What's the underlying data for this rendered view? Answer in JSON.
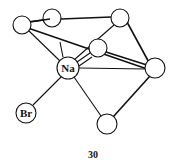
{
  "figure": {
    "caption": "30",
    "colors": {
      "stroke": "#111111",
      "background": "#ffffff"
    }
  },
  "atoms": [
    {
      "id": "c1",
      "label": "",
      "x": 22,
      "y": 25,
      "r": 9
    },
    {
      "id": "c2",
      "label": "",
      "x": 52,
      "y": 18,
      "r": 9
    },
    {
      "id": "c3",
      "label": "",
      "x": 120,
      "y": 18,
      "r": 9
    },
    {
      "id": "c4",
      "label": "",
      "x": 98,
      "y": 48,
      "r": 9
    },
    {
      "id": "na",
      "label": "Na",
      "x": 68,
      "y": 68,
      "r": 11
    },
    {
      "id": "c5",
      "label": "",
      "x": 155,
      "y": 68,
      "r": 10
    },
    {
      "id": "br",
      "label": "Br",
      "x": 26,
      "y": 113,
      "r": 10
    },
    {
      "id": "c6",
      "label": "",
      "x": 107,
      "y": 124,
      "r": 10
    }
  ],
  "bonds": [
    {
      "from": "c1",
      "to": "c2"
    },
    {
      "from": "c2",
      "to": "c3"
    },
    {
      "from": "c1",
      "to": "c5"
    },
    {
      "from": "c3",
      "to": "c5"
    },
    {
      "from": "c3",
      "to": "na"
    },
    {
      "from": "c4",
      "to": "na"
    },
    {
      "from": "c4",
      "to": "c5"
    },
    {
      "from": "c1",
      "to": "na"
    },
    {
      "from": "na",
      "to": "c5"
    },
    {
      "from": "na",
      "to": "br"
    },
    {
      "from": "na",
      "to": "c6"
    },
    {
      "from": "c5",
      "to": "c6"
    }
  ]
}
